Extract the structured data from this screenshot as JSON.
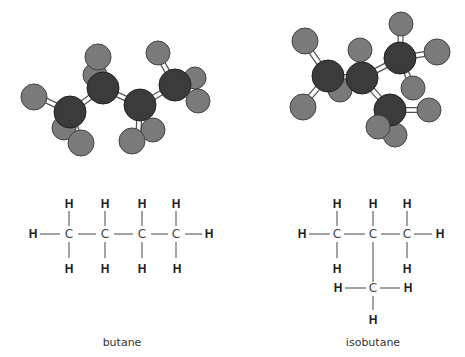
{
  "molecules": [
    {
      "name": "butane",
      "formula_atoms": {
        "carbons": 4,
        "hydrogens": 10
      }
    },
    {
      "name": "isobutane",
      "formula_atoms": {
        "carbons": 4,
        "hydrogens": 10
      }
    }
  ],
  "labels": {
    "H": "H",
    "C": "C"
  },
  "colors": {
    "carbon": "#3b3b3b",
    "hydrogen": "#7a7a7a",
    "background": "#ffffff"
  }
}
